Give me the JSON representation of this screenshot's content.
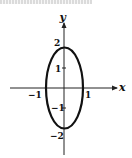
{
  "figure": {
    "type": "ellipse-graph",
    "top_text": "",
    "axes": {
      "x_label": "x",
      "y_label": "y"
    },
    "ticks": {
      "x": [
        {
          "value": -1,
          "label": "−1"
        },
        {
          "value": 1,
          "label": "1"
        }
      ],
      "y": [
        {
          "value": 2,
          "label": "2"
        },
        {
          "value": 1,
          "label": "1"
        },
        {
          "value": -1,
          "label": "−1"
        },
        {
          "value": -2,
          "label": "−2"
        }
      ]
    },
    "curve": {
      "shape": "ellipse",
      "center": [
        0,
        0
      ],
      "semi_axis_x": 1,
      "semi_axis_y": 2,
      "stroke_color": "#111111"
    },
    "colors": {
      "axis": "#222222",
      "curve": "#111111",
      "background": "#ffffff"
    }
  }
}
